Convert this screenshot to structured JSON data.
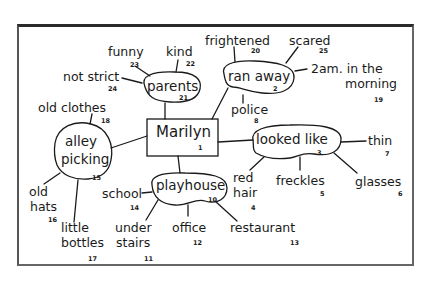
{
  "diagram": {
    "type": "mind-map",
    "center": {
      "label": "Marilyn",
      "number": "1"
    },
    "nodes": [
      {
        "label": "ran away",
        "number": "2"
      },
      {
        "label": "looked like",
        "number": "3"
      },
      {
        "label": "playhouse",
        "number": "10"
      },
      {
        "label": "alley picking",
        "line1": "alley",
        "line2": "picking",
        "number": "15"
      },
      {
        "label": "parents",
        "number": "21"
      }
    ],
    "leaves": [
      {
        "label": "red hair",
        "line1": "red",
        "line2": "hair",
        "number": "4",
        "parent": "looked like"
      },
      {
        "label": "freckles",
        "number": "5",
        "parent": "looked like"
      },
      {
        "label": "glasses",
        "number": "6",
        "parent": "looked like"
      },
      {
        "label": "thin",
        "number": "7",
        "parent": "looked like"
      },
      {
        "label": "police",
        "number": "8",
        "parent": "ran away"
      },
      {
        "label": "under stairs",
        "line1": "under",
        "line2": "stairs",
        "number": "11",
        "parent": "playhouse"
      },
      {
        "label": "office",
        "number": "12",
        "parent": "playhouse"
      },
      {
        "label": "restaurant",
        "number": "13",
        "parent": "playhouse"
      },
      {
        "label": "school",
        "number": "14",
        "parent": "playhouse"
      },
      {
        "label": "old hats",
        "line1": "old",
        "line2": "hats",
        "number": "16",
        "parent": "alley picking"
      },
      {
        "label": "little bottles",
        "line1": "little",
        "line2": "bottles",
        "number": "17",
        "parent": "alley picking"
      },
      {
        "label": "old clothes",
        "number": "18",
        "parent": "alley picking"
      },
      {
        "label": "2am in the morning",
        "line1": "2am. in the",
        "line2": "morning",
        "number": "19",
        "parent": "ran away"
      },
      {
        "label": "frightened",
        "number": "20",
        "parent": "ran away"
      },
      {
        "label": "kind",
        "number": "22",
        "parent": "parents"
      },
      {
        "label": "funny",
        "number": "23",
        "parent": "parents"
      },
      {
        "label": "not strict",
        "number": "24",
        "parent": "parents"
      },
      {
        "label": "scared",
        "number": "25",
        "parent": "ran away"
      }
    ]
  }
}
